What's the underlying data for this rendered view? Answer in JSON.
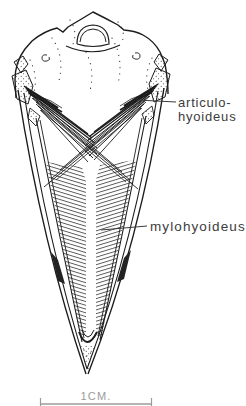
{
  "figure": {
    "type": "anatomical-line-drawing",
    "labels": {
      "articulo_line1": "articulo-",
      "articulo_line2": "hyoideus",
      "mylohyoideus": "mylohyoideus"
    },
    "scale_bar": {
      "label": "1CM."
    },
    "colors": {
      "background": "#ffffff",
      "ink": "#1c1c1c",
      "label_text": "#3c3c3c",
      "scale_gray": "#9b9b9b"
    }
  }
}
